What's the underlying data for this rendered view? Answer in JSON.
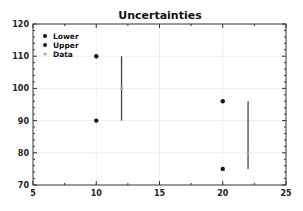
{
  "chart_data": {
    "type": "scatter",
    "title": "Uncertainties",
    "xlabel": "",
    "ylabel": "",
    "xlim": [
      5,
      25
    ],
    "ylim": [
      70,
      120
    ],
    "x_ticks": [
      5,
      10,
      15,
      20,
      25
    ],
    "y_ticks": [
      70,
      80,
      90,
      100,
      110,
      120
    ],
    "grid": true,
    "legend_position": "upper left",
    "series": [
      {
        "name": "Lower",
        "type": "scatter",
        "color": "#111111",
        "points": [
          {
            "x": 10,
            "y": 90
          },
          {
            "x": 20,
            "y": 75
          }
        ]
      },
      {
        "name": "Upper",
        "type": "scatter",
        "color": "#111111",
        "points": [
          {
            "x": 10,
            "y": 110
          },
          {
            "x": 20,
            "y": 96
          }
        ]
      },
      {
        "name": "Data",
        "type": "errorbar",
        "color": "#aaaaaa",
        "bar_color": "#444444",
        "points": [
          {
            "x": 12,
            "y": 100,
            "ylow": 90,
            "yhigh": 110
          },
          {
            "x": 22,
            "y": 80,
            "ylow": 75,
            "yhigh": 96
          }
        ]
      }
    ]
  }
}
